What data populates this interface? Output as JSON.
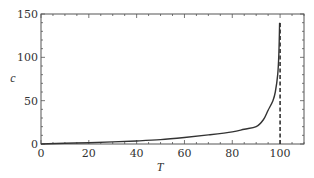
{
  "chart_data": {
    "type": "line",
    "title": "",
    "xlabel": "T",
    "ylabel": "c",
    "xlim": [
      0,
      110
    ],
    "ylim": [
      0,
      150
    ],
    "xticks": [
      0,
      20,
      40,
      60,
      80,
      100
    ],
    "yticks": [
      0,
      50,
      100,
      150
    ],
    "x_minor_step": 5,
    "y_minor_step": 10,
    "grid": false,
    "legend": null,
    "series": [
      {
        "name": "c(T)",
        "style": "solid",
        "color": "#333333",
        "x": [
          0,
          10,
          20,
          30,
          40,
          50,
          60,
          70,
          80,
          85,
          90,
          93,
          95,
          97,
          98,
          99,
          99.5,
          99.8
        ],
        "y": [
          0,
          0.8,
          1.5,
          2.4,
          3.5,
          5,
          7.5,
          10.5,
          14,
          17,
          20,
          28,
          39,
          50,
          60,
          80,
          105,
          140
        ]
      }
    ],
    "annotations": [
      {
        "type": "vline",
        "x": 100,
        "style": "dashed",
        "color": "#333333",
        "y_from": 0,
        "y_to": 140
      }
    ]
  },
  "labels": {
    "xlabel": "T",
    "ylabel": "c",
    "xticks": [
      "0",
      "20",
      "40",
      "60",
      "80",
      "100"
    ],
    "yticks": [
      "0",
      "50",
      "100",
      "150"
    ]
  }
}
